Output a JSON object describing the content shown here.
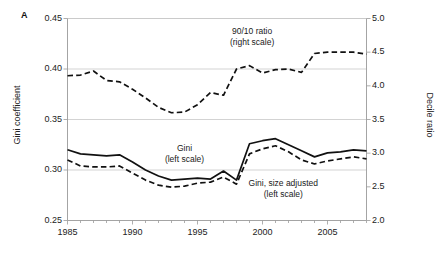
{
  "figure": {
    "panel_label": "A",
    "background": "#ffffff"
  },
  "axes": {
    "left_title": "Gini coefficient",
    "right_title": "Decile ratio",
    "x_title": "",
    "left_ticks": [
      "0.45",
      "0.40",
      "0.35",
      "0.30",
      "0.25"
    ],
    "right_ticks": [
      "5.0",
      "4.5",
      "4.0",
      "3.5",
      "3.0",
      "2.5",
      "2.0"
    ],
    "x_ticks": [
      "1985",
      "1990",
      "1995",
      "2000",
      "2005"
    ]
  },
  "annotations": [
    {
      "id": "ann-ratio",
      "line1": "90/10 ratio",
      "line2": "(right scale)"
    },
    {
      "id": "ann-gini",
      "line1": "Gini",
      "line2": "(left scale)"
    },
    {
      "id": "ann-gini-adj",
      "line1": "Gini, size adjusted",
      "line2": "(left scale)"
    }
  ],
  "chart_data": {
    "type": "line",
    "title": "",
    "subtitle": "",
    "panel": "A",
    "xlabel": "",
    "ylabel": "Gini coefficient",
    "y2label": "Decile ratio",
    "xlim": [
      1985,
      2008
    ],
    "ylim": [
      0.25,
      0.45
    ],
    "y2lim": [
      2.0,
      5.0
    ],
    "ytick_values": [
      0.45,
      0.4,
      0.35,
      0.3,
      0.25
    ],
    "y2tick_values": [
      5.0,
      4.5,
      4.0,
      3.5,
      3.0,
      2.5,
      2.0
    ],
    "xtick_values": [
      1985,
      1990,
      1995,
      2000,
      2005
    ],
    "xtick_minor_step": 1,
    "grid": "horizontal-major",
    "legend": "inline-annotations",
    "x": [
      1985,
      1986,
      1987,
      1988,
      1989,
      1990,
      1991,
      1992,
      1993,
      1994,
      1995,
      1996,
      1997,
      1998,
      1999,
      2000,
      2001,
      2002,
      2003,
      2004,
      2005,
      2006,
      2007,
      2008
    ],
    "series": [
      {
        "name": "90/10 ratio",
        "scale": "right",
        "style": "dashed",
        "color": "#111111",
        "values": [
          4.15,
          4.16,
          4.22,
          4.08,
          4.06,
          3.95,
          3.82,
          3.68,
          3.6,
          3.61,
          3.72,
          3.9,
          3.86,
          4.25,
          4.3,
          4.19,
          4.24,
          4.25,
          4.2,
          4.48,
          4.5,
          4.5,
          4.5,
          4.47
        ]
      },
      {
        "name": "Gini",
        "scale": "left",
        "style": "solid",
        "color": "#111111",
        "values": [
          0.32,
          0.316,
          0.315,
          0.314,
          0.315,
          0.308,
          0.3,
          0.294,
          0.29,
          0.291,
          0.292,
          0.291,
          0.299,
          0.29,
          0.326,
          0.329,
          0.331,
          0.325,
          0.319,
          0.313,
          0.317,
          0.318,
          0.32,
          0.319
        ]
      },
      {
        "name": "Gini, size adjusted",
        "scale": "left",
        "style": "dashed",
        "color": "#111111",
        "values": [
          0.31,
          0.304,
          0.303,
          0.303,
          0.304,
          0.297,
          0.29,
          0.285,
          0.283,
          0.284,
          0.287,
          0.288,
          0.293,
          0.286,
          0.316,
          0.321,
          0.324,
          0.318,
          0.31,
          0.306,
          0.309,
          0.311,
          0.313,
          0.311
        ]
      }
    ]
  }
}
